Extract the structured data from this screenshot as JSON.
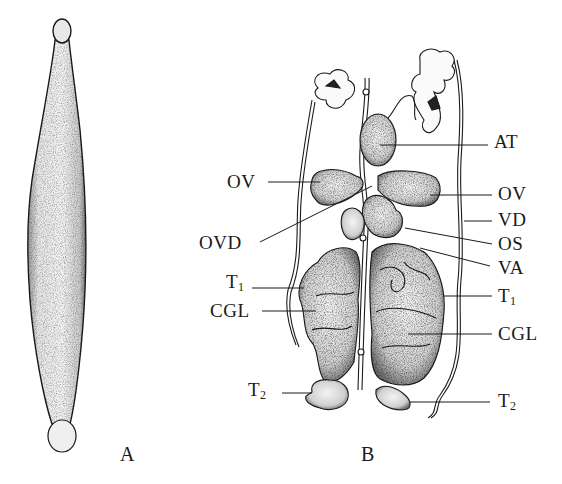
{
  "figure": {
    "panels": [
      {
        "id": "A",
        "label": "A",
        "description": "whole elongate fusiform body with rounded bulb at each end"
      },
      {
        "id": "B",
        "label": "B",
        "description": "dissected internal reproductive anatomy"
      }
    ],
    "labels": {
      "AT": "AT",
      "OV_left": "OV",
      "OV_right": "OV",
      "VD": "VD",
      "OVD": "OVD",
      "OS": "OS",
      "VA": "VA",
      "T1_left_base": "T",
      "T1_left_sub": "1",
      "T1_right_base": "T",
      "T1_right_sub": "1",
      "CGL_left": "CGL",
      "CGL_right": "CGL",
      "T2_left_base": "T",
      "T2_left_sub": "2",
      "T2_right_base": "T",
      "T2_right_sub": "2"
    },
    "colors": {
      "ink": "#1a1a1a",
      "stipple": "#3a3a3a",
      "paper": "#ffffff"
    }
  }
}
